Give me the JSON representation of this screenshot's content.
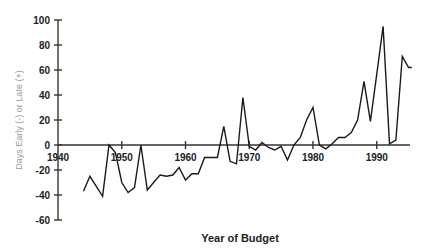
{
  "chart_data": {
    "type": "line",
    "title": "",
    "xlabel": "Year of Budget",
    "ylabel": "Days Early (-) or Late (+)",
    "xlim": [
      1940,
      1996
    ],
    "ylim": [
      -60,
      100
    ],
    "x_ticks": [
      1940,
      1950,
      1960,
      1970,
      1980,
      1990
    ],
    "x_tick_labels": [
      "1940",
      "1950",
      "1960",
      "1970",
      "1980",
      "1990"
    ],
    "y_ticks": [
      -60,
      -40,
      -20,
      0,
      20,
      40,
      60,
      80,
      100
    ],
    "y_tick_labels": [
      "-60",
      "-40",
      "-20",
      "0",
      "20",
      "40",
      "60",
      "80",
      "100"
    ],
    "grid": false,
    "legend": "none",
    "series": [
      {
        "name": "Days early or late",
        "x": [
          1944,
          1945,
          1946,
          1947,
          1948,
          1949,
          1950,
          1951,
          1952,
          1953,
          1954,
          1955,
          1956,
          1957,
          1958,
          1959,
          1960,
          1961,
          1962,
          1963,
          1964,
          1965,
          1966,
          1967,
          1968,
          1969,
          1970,
          1971,
          1972,
          1973,
          1974,
          1975,
          1976,
          1977,
          1978,
          1979,
          1980,
          1981,
          1982,
          1983,
          1984,
          1985,
          1986,
          1987,
          1988,
          1989,
          1990,
          1991,
          1992,
          1993,
          1994,
          1995,
          1995.5
        ],
        "values": [
          -37,
          -25,
          -33,
          -41,
          0,
          -6,
          -30,
          -38,
          -34,
          0,
          -36,
          -30,
          -24,
          -25,
          -24,
          -18,
          -28,
          -23,
          -23,
          -10,
          -10,
          -10,
          15,
          -13,
          -15,
          38,
          -1,
          -4,
          2,
          -2,
          -4,
          -1,
          -12,
          0,
          6,
          20,
          30,
          0,
          -3,
          1,
          6,
          6,
          10,
          20,
          51,
          19,
          57,
          95,
          1,
          4,
          71,
          62,
          62
        ]
      }
    ]
  }
}
